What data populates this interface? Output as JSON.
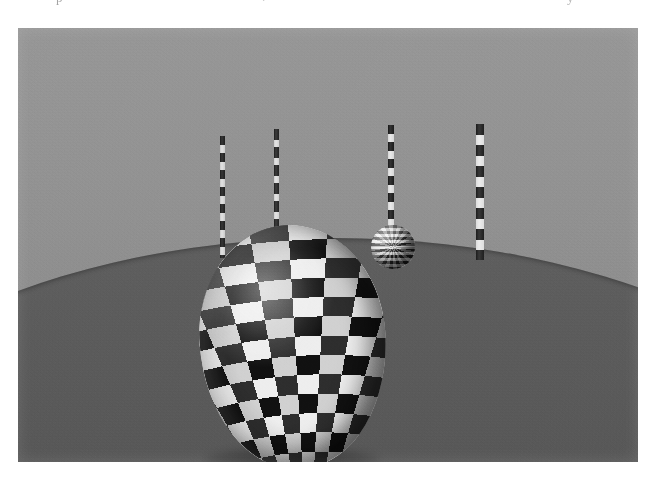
{
  "page": {
    "width": 657,
    "height": 483,
    "background_color": "#ffffff",
    "scan_artifacts": [
      "p",
      ".",
      "'",
      "y"
    ]
  },
  "figure": {
    "name": "rendered-3d-scene",
    "caption": "",
    "frame": {
      "left": 18,
      "top": 28,
      "width": 620,
      "height": 434
    },
    "render_style": "grayscale ray-traced / rasterized 3D render with scan grain",
    "palette": {
      "backdrop_light": "#979797",
      "backdrop_dark": "#898989",
      "ground_light": "#5f5f5f",
      "ground_dark": "#4d4d4d",
      "checker_dark": "#2e2e2e",
      "checker_light": "#eeeeee"
    },
    "scene": {
      "backdrop_label": "gradient backdrop",
      "ground_label": "curved ground plane",
      "horizon": {
        "left_y": 288,
        "peak_x": 430,
        "peak_y": 254,
        "right_y": 276
      },
      "objects": [
        {
          "id": "egg",
          "label": "large checkered ellipsoid",
          "shape": "ellipsoid",
          "texture": "checkerboard",
          "left": 182,
          "top": 197,
          "width": 186,
          "height": 243,
          "rotation_deg": -4
        },
        {
          "id": "small-sphere",
          "label": "small checkered sphere",
          "shape": "sphere",
          "texture": "fine checkerboard",
          "left": 353,
          "top": 197,
          "width": 44,
          "height": 44
        }
      ],
      "poles": [
        {
          "id": "pole-1",
          "label": "pole 1",
          "left": 202,
          "top": 108,
          "width": 5,
          "height": 122,
          "segment_px": 9
        },
        {
          "id": "pole-2",
          "label": "pole 2",
          "left": 256,
          "top": 101,
          "width": 5,
          "height": 126,
          "segment_px": 11
        },
        {
          "id": "pole-3",
          "label": "pole 3",
          "left": 370,
          "top": 97,
          "width": 6,
          "height": 124,
          "segment_px": 9
        },
        {
          "id": "pole-4",
          "label": "pole 4",
          "left": 458,
          "top": 96,
          "width": 8,
          "height": 136,
          "segment_px": 11
        }
      ]
    }
  }
}
